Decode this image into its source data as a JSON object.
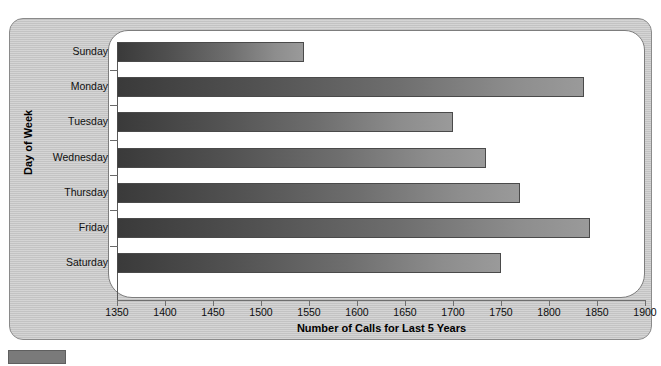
{
  "chart_data": {
    "type": "bar",
    "orientation": "horizontal",
    "title": "",
    "xlabel": "Number of Calls for Last 5 Years",
    "ylabel": "Day of Week",
    "categories": [
      "Sunday",
      "Monday",
      "Tuesday",
      "Wednesday",
      "Thursday",
      "Friday",
      "Saturday"
    ],
    "values": [
      1545,
      1836,
      1700,
      1734,
      1770,
      1843,
      1750
    ],
    "series": [
      {
        "name": "Number of Calls for Last 5 Years",
        "values": [
          1545,
          1836,
          1700,
          1734,
          1770,
          1843,
          1750
        ]
      }
    ],
    "xlim": [
      1350,
      1900
    ],
    "xticks": [
      1350,
      1400,
      1450,
      1500,
      1550,
      1600,
      1650,
      1700,
      1750,
      1800,
      1850,
      1900
    ],
    "xtick_labels": [
      "1350",
      "1400",
      "1450",
      "1500",
      "1550",
      "1600",
      "1650",
      "1700",
      "1750",
      "1800",
      "1850",
      "1900"
    ],
    "grid": false,
    "legend": null,
    "bar_fill": "gradient-dark-to-light-gray",
    "bar_color_start": "#3a3a3a",
    "bar_color_end": "#9a9a9a",
    "bar_border_color": "#4a4a4a",
    "plot_background": "#ffffff",
    "figure_background": "#c9c9c9"
  },
  "axes": {
    "x_title": "Number of Calls for Last 5 Years",
    "y_title": "Day of Week"
  },
  "caption": {
    "badge_label": "",
    "text": ""
  }
}
